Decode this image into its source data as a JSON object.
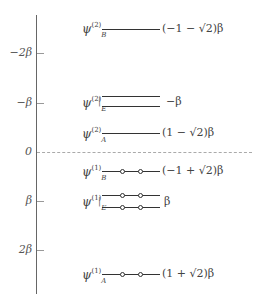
{
  "axis": {
    "ticks": [
      {
        "label": "−2β",
        "y": 53
      },
      {
        "label": "−β",
        "y": 103
      },
      {
        "label": "0",
        "y": 152
      },
      {
        "label": "β",
        "y": 201
      },
      {
        "label": "2β",
        "y": 250
      }
    ]
  },
  "levels": {
    "psiB2": {
      "psi": "ψ",
      "sup": "(2)",
      "sub": "B",
      "energy": "(−1 − √2)β"
    },
    "psiE2": {
      "psi": "ψ",
      "sup": "(2)",
      "sub": "E",
      "energy": "−β"
    },
    "psiA2": {
      "psi": "ψ",
      "sup": "(2)",
      "sub": "A",
      "energy": "(1 − √2)β"
    },
    "psiB1": {
      "psi": "ψ",
      "sup": "(1)",
      "sub": "B",
      "energy": "(−1 + √2)β"
    },
    "psiE1": {
      "psi": "ψ",
      "sup": "(1)",
      "sub": "E",
      "energy": "β"
    },
    "psiA1": {
      "psi": "ψ",
      "sup": "(1)",
      "sub": "A",
      "energy": "(1 + √2)β"
    }
  },
  "brace": "|"
}
